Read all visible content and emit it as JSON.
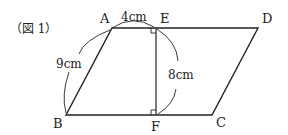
{
  "figure": {
    "caption": "（図 1）",
    "points": {
      "A": "A",
      "E": "E",
      "D": "D",
      "B": "B",
      "F": "F",
      "C": "C"
    },
    "dimensions": {
      "AE": "4cm",
      "AB": "9cm",
      "EF": "8cm"
    },
    "shape": "parallelogram ABCD with perpendicular EF"
  }
}
